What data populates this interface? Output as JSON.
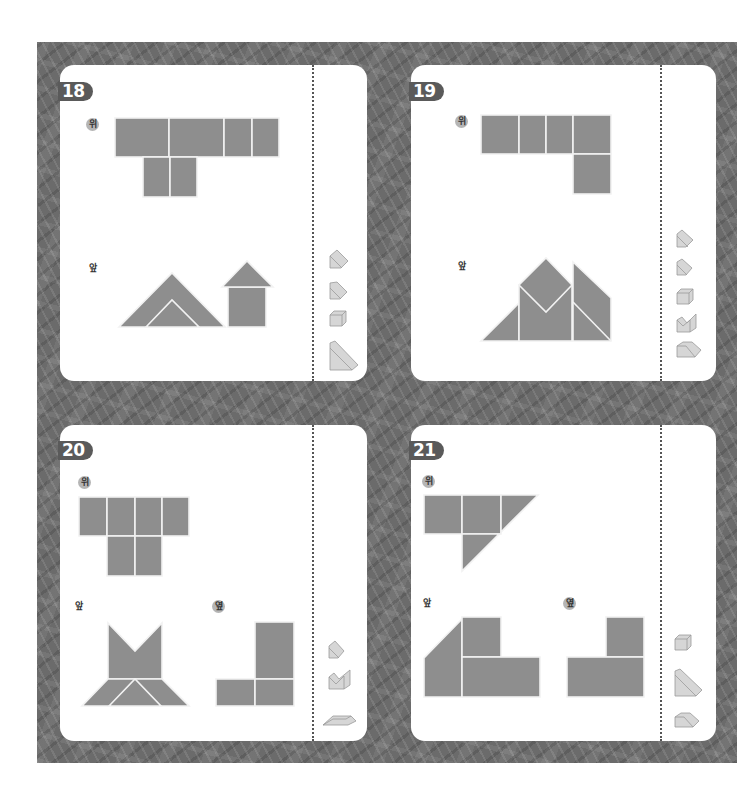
{
  "colors": {
    "background_pattern": "#6b6b6b",
    "card": "#ffffff",
    "badge": "#5a5a5a",
    "shape_fill": "#8e8e8e",
    "shape_outline": "#f2f2f2",
    "piece_icon_fill": "#d6d6d6"
  },
  "puzzles": [
    {
      "number": "18",
      "views": [
        {
          "label": "위",
          "view": "top"
        },
        {
          "label": "앞",
          "view": "front"
        }
      ],
      "piece_icons": [
        "triangular-prism-icon",
        "triangular-prism-icon",
        "cube-icon",
        "large-triangular-prism-icon"
      ]
    },
    {
      "number": "19",
      "views": [
        {
          "label": "위",
          "view": "top"
        },
        {
          "label": "앞",
          "view": "front"
        }
      ],
      "piece_icons": [
        "triangular-prism-icon",
        "triangular-prism-icon",
        "cube-icon",
        "v-notch-block-icon",
        "slanted-block-icon"
      ]
    },
    {
      "number": "20",
      "views": [
        {
          "label": "위",
          "view": "top"
        },
        {
          "label": "앞",
          "view": "front"
        },
        {
          "label": "옆",
          "view": "side"
        }
      ],
      "piece_icons": [
        "triangular-prism-icon",
        "v-notch-block-icon",
        "trapezoid-prism-icon"
      ]
    },
    {
      "number": "21",
      "views": [
        {
          "label": "위",
          "view": "top"
        },
        {
          "label": "앞",
          "view": "front"
        },
        {
          "label": "옆",
          "view": "side"
        }
      ],
      "piece_icons": [
        "cube-icon",
        "large-triangular-prism-icon",
        "slanted-block-icon"
      ]
    }
  ]
}
